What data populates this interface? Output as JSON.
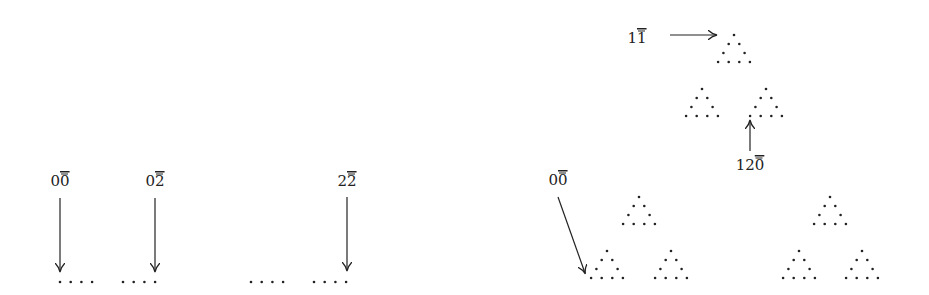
{
  "colors": {
    "ink": "#222222",
    "background": "#ffffff"
  },
  "left_diagram": {
    "labels": [
      {
        "id": "l00",
        "text_main": "0",
        "text_bar": "0",
        "x": 60,
        "y": 186
      },
      {
        "id": "l02",
        "text_main": "0",
        "text_bar": "2",
        "x": 155,
        "y": 186
      },
      {
        "id": "l22",
        "text_main": "2",
        "text_bar": "2",
        "x": 347,
        "y": 186
      }
    ],
    "arrows": [
      {
        "x1": 60,
        "y1": 198,
        "x2": 60,
        "y2": 271
      },
      {
        "x1": 155,
        "y1": 198,
        "x2": 155,
        "y2": 271
      },
      {
        "x1": 347,
        "y1": 197,
        "x2": 347,
        "y2": 270
      }
    ],
    "dot_groups": [
      {
        "x0": 60,
        "y": 282,
        "n": 4,
        "step": 10.7
      },
      {
        "x0": 123,
        "y": 282,
        "n": 4,
        "step": 10.7
      },
      {
        "x0": 251,
        "y": 282,
        "n": 4,
        "step": 10.7
      },
      {
        "x0": 314,
        "y": 282,
        "n": 4,
        "step": 10.7
      }
    ]
  },
  "right_diagram": {
    "labels": [
      {
        "id": "l11",
        "text_main": "1",
        "text_bar": "1",
        "x": 637,
        "y": 43
      },
      {
        "id": "l120",
        "text_main": "12",
        "text_bar": "0",
        "x": 750,
        "y": 170
      },
      {
        "id": "l00r",
        "text_main": "0",
        "text_bar": "0",
        "x": 558,
        "y": 185
      }
    ],
    "arrows": [
      {
        "x1": 670,
        "y1": 35,
        "x2": 716,
        "y2": 35
      },
      {
        "x1": 750,
        "y1": 151,
        "x2": 750,
        "y2": 121
      },
      {
        "x1": 558,
        "y1": 197,
        "x2": 585,
        "y2": 273
      }
    ],
    "triangles": [
      {
        "apex_x": 734,
        "apex_y": 35
      },
      {
        "apex_x": 702,
        "apex_y": 89
      },
      {
        "apex_x": 766,
        "apex_y": 89
      },
      {
        "apex_x": 639,
        "apex_y": 197
      },
      {
        "apex_x": 830,
        "apex_y": 197
      },
      {
        "apex_x": 607,
        "apex_y": 251
      },
      {
        "apex_x": 671,
        "apex_y": 251
      },
      {
        "apex_x": 799,
        "apex_y": 251
      },
      {
        "apex_x": 862,
        "apex_y": 251
      }
    ],
    "triangle_spec": {
      "dx": 5.3,
      "dy": 9,
      "rows": 4
    }
  }
}
